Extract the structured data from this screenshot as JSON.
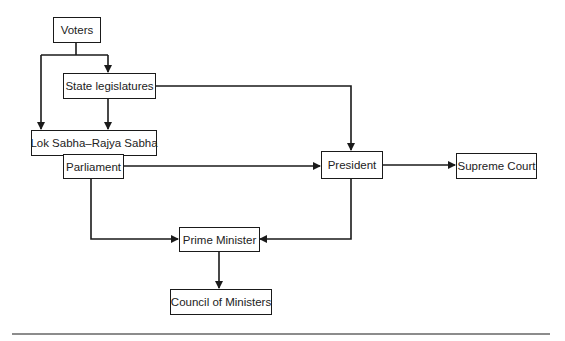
{
  "diagram": {
    "type": "flowchart",
    "title": "",
    "nodes": [
      {
        "id": "voters",
        "label": "Voters"
      },
      {
        "id": "state_legislatures",
        "label": "State legislatures"
      },
      {
        "id": "lok_rajya",
        "label": "Lok Sabha–Rajya Sabha"
      },
      {
        "id": "parliament",
        "label": "Parliament"
      },
      {
        "id": "president",
        "label": "President"
      },
      {
        "id": "supreme_court",
        "label": "Supreme Court"
      },
      {
        "id": "prime_minister",
        "label": "Prime Minister"
      },
      {
        "id": "council",
        "label": "Council of Ministers"
      }
    ],
    "edges": [
      {
        "from": "voters",
        "to": "state_legislatures"
      },
      {
        "from": "voters",
        "to": "lok_rajya"
      },
      {
        "from": "state_legislatures",
        "to": "lok_rajya"
      },
      {
        "from": "state_legislatures",
        "to": "president"
      },
      {
        "from": "parliament",
        "to": "president"
      },
      {
        "from": "president",
        "to": "supreme_court"
      },
      {
        "from": "parliament",
        "to": "prime_minister"
      },
      {
        "from": "president",
        "to": "prime_minister"
      },
      {
        "from": "prime_minister",
        "to": "council"
      }
    ]
  },
  "colors": {
    "stroke": "#1a1a1a",
    "text": "#222222",
    "rule": "#8c8c8c",
    "background": "#ffffff"
  }
}
